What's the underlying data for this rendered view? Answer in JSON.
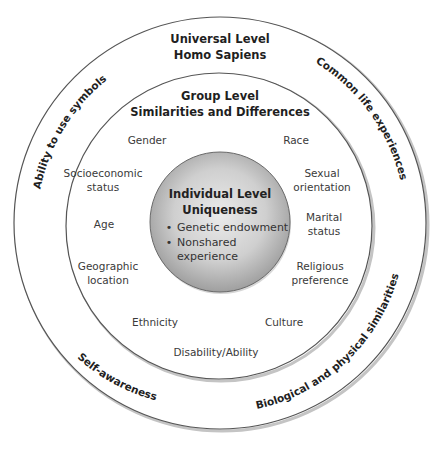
{
  "universal": {
    "title": "Universal Level",
    "subtitle": "Homo Sapiens",
    "arc_labels": {
      "top_left": "Ability to use symbols",
      "top_right": "Common life experiences",
      "bottom_left": "Self-awareness",
      "bottom_right": "Biological and physical similarities"
    }
  },
  "group": {
    "title": "Group Level",
    "subtitle": "Similarities and Differences",
    "items": {
      "gender": "Gender",
      "race": "Race",
      "socioeconomic_1": "Socioeconomic",
      "socioeconomic_2": "status",
      "sexual_1": "Sexual",
      "sexual_2": "orientation",
      "age": "Age",
      "marital_1": "Marital",
      "marital_2": "status",
      "geographic_1": "Geographic",
      "geographic_2": "location",
      "religious_1": "Religious",
      "religious_2": "preference",
      "ethnicity": "Ethnicity",
      "culture": "Culture",
      "disability": "Disability/Ability"
    }
  },
  "individual": {
    "title": "Individual Level",
    "subtitle": "Uniqueness",
    "bullet": "•",
    "bullets": {
      "genetic": "Genetic endowment",
      "nonshared_1": "Nonshared",
      "nonshared_2": "experience"
    }
  },
  "colors": {
    "ring_stroke": "#555555",
    "ring_shadow": "#b5b5b5",
    "inner_fill_center": "#e6e6e6",
    "inner_fill_edge": "#a8a8a8",
    "background": "#ffffff"
  }
}
